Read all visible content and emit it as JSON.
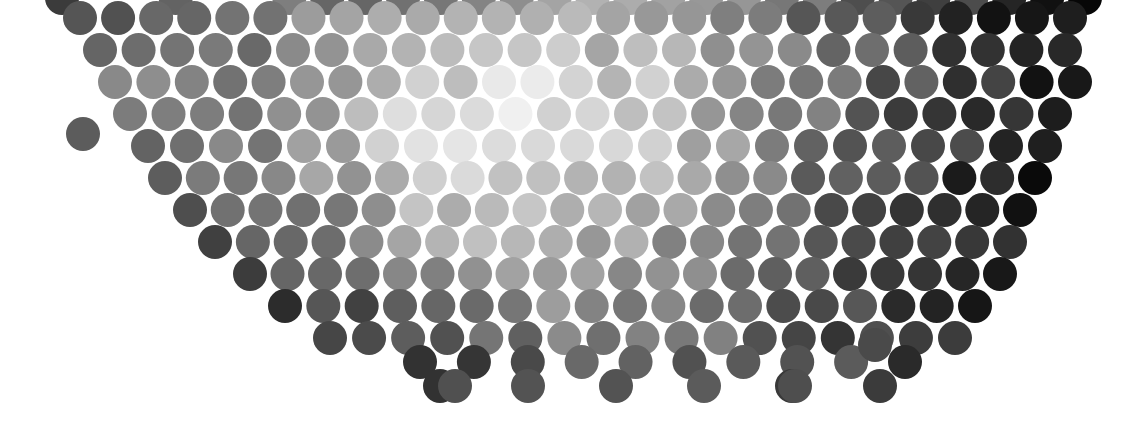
{
  "artwork": {
    "title": "Halftone Dot Grid",
    "description": "Hexagonally packed circles of varying grey values forming a bowl-shaped cluster, light at the centre and dark toward the right and lower edges.",
    "canvas": {
      "width": 1138,
      "height": 423,
      "background_color": "#ffffff"
    },
    "geometry": {
      "lattice": "hexagonal",
      "column_pitch": 37.5,
      "row_pitch": 32,
      "circle_diameter": 34,
      "circle_radius": 17,
      "row_offset": 18.75,
      "first_row_center_y": -2,
      "first_col_center_x": 25
    },
    "palette": {
      "lightest": "#e2e2e2",
      "light": "#c8c8c8",
      "mid_light": "#b0b0b0",
      "mid": "#989898",
      "mid_dark": "#7a7a7a",
      "dark": "#5a5a5a",
      "darkest": "#3a3a3a",
      "background": "#ffffff"
    },
    "gradient_model": {
      "light_center_x": 575,
      "light_center_y": 140,
      "notes": "Grey value increases (darkens) with distance from the light centre, with extra darkening applied toward the right edge and the lower boundary."
    },
    "boundary": {
      "shape": "rounded V / bowl",
      "top_edge_y": -2,
      "bottom_row_y": 386,
      "left_apex_x": 300,
      "right_apex_x": 960,
      "notes": "Dots fill the upper band fully; the lower boundary slopes inward from both sides meeting near the lower middle."
    }
  },
  "chart_data": {
    "type": "scatter",
    "xlabel": "",
    "ylabel": "",
    "xlim": [
      0,
      1138
    ],
    "ylim": [
      0,
      423
    ],
    "grid": false,
    "legend": null,
    "marker": "circle",
    "marker_diameter": 34,
    "encoding": "grey value (0 = black, 255 = white)",
    "rows": [
      {
        "y": -2,
        "x_start": 62,
        "x_end": 1085,
        "count": 28,
        "greys": [
          110,
          255,
          255,
          118,
          255,
          255,
          128,
          132,
          136,
          140,
          150,
          160,
          170,
          178,
          182,
          175,
          168,
          160,
          150,
          140,
          128,
          116,
          104,
          92,
          80,
          70,
          62,
          56
        ]
      },
      {
        "y": 18,
        "x_start": 80,
        "x_end": 1070,
        "count": 27,
        "greys": [
          120,
          124,
          128,
          132,
          138,
          146,
          156,
          166,
          176,
          186,
          192,
          196,
          192,
          186,
          178,
          168,
          158,
          146,
          134,
          122,
          110,
          98,
          86,
          74,
          64,
          56,
          50
        ]
      },
      {
        "y": 50,
        "x_start": 100,
        "x_end": 1065,
        "count": 26,
        "greys": [
          112,
          118,
          124,
          130,
          140,
          152,
          164,
          176,
          188,
          198,
          204,
          208,
          204,
          196,
          186,
          174,
          162,
          148,
          134,
          120,
          106,
          94,
          82,
          70,
          60,
          52
        ]
      },
      {
        "y": 82,
        "x_start": 115,
        "x_end": 1075,
        "count": 26,
        "greys": [
          150,
          158,
          140,
          132,
          146,
          160,
          176,
          190,
          202,
          212,
          218,
          220,
          214,
          206,
          194,
          180,
          166,
          150,
          136,
          122,
          108,
          94,
          82,
          70,
          60,
          50
        ]
      },
      {
        "y": 114,
        "x_start": 130,
        "x_end": 1055,
        "count": 25,
        "greys": [
          128,
          134,
          142,
          152,
          166,
          182,
          196,
          208,
          216,
          222,
          224,
          220,
          212,
          200,
          186,
          170,
          154,
          138,
          124,
          110,
          96,
          84,
          72,
          62,
          52
        ]
      },
      {
        "y": 146,
        "x_start": 148,
        "x_end": 1045,
        "count": 24,
        "greys": [
          120,
          128,
          138,
          150,
          166,
          184,
          200,
          212,
          220,
          224,
          222,
          216,
          206,
          192,
          176,
          160,
          144,
          128,
          114,
          100,
          88,
          76,
          66,
          56
        ]
      },
      {
        "y": 178,
        "x_start": 165,
        "x_end": 1035,
        "count": 24,
        "greys": [
          112,
          120,
          130,
          144,
          160,
          178,
          194,
          206,
          214,
          216,
          212,
          204,
          192,
          178,
          162,
          146,
          130,
          116,
          102,
          90,
          78,
          68,
          58,
          50
        ]
      },
      {
        "y": 210,
        "x_start": 190,
        "x_end": 1020,
        "count": 23,
        "greys": [
          104,
          112,
          122,
          136,
          152,
          168,
          184,
          196,
          202,
          204,
          198,
          188,
          176,
          162,
          146,
          132,
          118,
          104,
          92,
          80,
          70,
          60,
          52
        ]
      },
      {
        "y": 242,
        "x_start": 215,
        "x_end": 1010,
        "count": 22,
        "greys": [
          98,
          106,
          116,
          128,
          142,
          158,
          172,
          182,
          188,
          188,
          182,
          172,
          160,
          146,
          132,
          118,
          106,
          94,
          82,
          72,
          62,
          54
        ]
      },
      {
        "y": 274,
        "x_start": 250,
        "x_end": 1000,
        "count": 21,
        "greys": [
          92,
          100,
          108,
          120,
          134,
          148,
          160,
          170,
          174,
          172,
          166,
          156,
          144,
          130,
          118,
          106,
          94,
          84,
          74,
          64,
          56
        ]
      },
      {
        "y": 306,
        "x_start": 285,
        "x_end": 975,
        "count": 19,
        "greys": [
          86,
          94,
          102,
          112,
          124,
          136,
          148,
          156,
          158,
          154,
          146,
          136,
          124,
          112,
          100,
          90,
          80,
          70,
          62
        ]
      },
      {
        "y": 338,
        "x_start": 330,
        "x_end": 955,
        "count": 17,
        "greys": [
          80,
          88,
          96,
          106,
          116,
          126,
          136,
          142,
          142,
          136,
          128,
          118,
          106,
          96,
          86,
          76,
          68
        ]
      },
      {
        "y": 362,
        "x_start": 420,
        "x_end": 905,
        "count": 10,
        "greys": [
          78,
          86,
          94,
          102,
          110,
          116,
          116,
          110,
          100,
          88
        ]
      },
      {
        "y": 386,
        "x_start": 440,
        "x_end": 880,
        "count": 6,
        "greys": [
          76,
          84,
          92,
          96,
          92,
          84
        ]
      }
    ],
    "isolated_dots": [
      {
        "x": 83,
        "y": 134,
        "grey": 92
      },
      {
        "x": 875,
        "y": 345,
        "grey": 74
      },
      {
        "x": 795,
        "y": 386,
        "grey": 78
      },
      {
        "x": 455,
        "y": 386,
        "grey": 80
      }
    ]
  }
}
